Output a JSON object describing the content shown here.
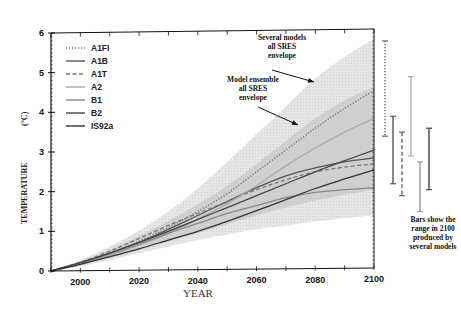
{
  "chart_data": {
    "type": "line",
    "title": "",
    "xlabel": "YEAR",
    "ylabel": "TEMPERATURE",
    "ylabel_unit": "(°C)",
    "xlim": [
      1990,
      2100
    ],
    "ylim": [
      0,
      6
    ],
    "x_ticks": [
      2000,
      2020,
      2040,
      2060,
      2080,
      2100
    ],
    "y_ticks": [
      0,
      1,
      2,
      3,
      4,
      5,
      6
    ],
    "grid": false,
    "legend_position": "upper-left",
    "x": [
      1990,
      2000,
      2010,
      2020,
      2030,
      2040,
      2050,
      2060,
      2070,
      2080,
      2090,
      2100
    ],
    "series": [
      {
        "name": "A1FI",
        "style": "dotted",
        "color": "#777777",
        "values": [
          0,
          0.2,
          0.45,
          0.75,
          1.1,
          1.5,
          1.95,
          2.5,
          3.05,
          3.6,
          4.1,
          4.55
        ]
      },
      {
        "name": "A1B",
        "style": "solid",
        "color": "#555555",
        "values": [
          0,
          0.2,
          0.45,
          0.72,
          1.05,
          1.4,
          1.75,
          2.1,
          2.4,
          2.6,
          2.75,
          2.85
        ]
      },
      {
        "name": "A1T",
        "style": "dashed",
        "color": "#777777",
        "values": [
          0,
          0.22,
          0.5,
          0.82,
          1.15,
          1.45,
          1.75,
          2.05,
          2.3,
          2.5,
          2.62,
          2.7
        ]
      },
      {
        "name": "A2",
        "style": "solid",
        "color": "#aaaaaa",
        "values": [
          0,
          0.19,
          0.4,
          0.65,
          0.95,
          1.3,
          1.7,
          2.15,
          2.65,
          3.1,
          3.5,
          3.85
        ]
      },
      {
        "name": "B1",
        "style": "solid",
        "color": "#888888",
        "values": [
          0,
          0.2,
          0.43,
          0.68,
          0.95,
          1.2,
          1.45,
          1.65,
          1.85,
          1.98,
          2.05,
          2.1
        ]
      },
      {
        "name": "B2",
        "style": "solid",
        "color": "#444444",
        "values": [
          0,
          0.21,
          0.45,
          0.72,
          1.0,
          1.3,
          1.6,
          1.9,
          2.2,
          2.5,
          2.78,
          3.05
        ]
      },
      {
        "name": "IS92a",
        "style": "solid",
        "color": "#333333",
        "values": [
          0,
          0.17,
          0.36,
          0.56,
          0.78,
          1.0,
          1.25,
          1.52,
          1.8,
          2.08,
          2.32,
          2.55
        ]
      }
    ],
    "envelopes": [
      {
        "name": "Several models all SRES envelope",
        "color": "#e4e4e4",
        "lower": [
          0,
          0.12,
          0.28,
          0.45,
          0.62,
          0.78,
          0.92,
          1.05,
          1.15,
          1.25,
          1.33,
          1.4
        ],
        "upper": [
          0,
          0.28,
          0.62,
          1.02,
          1.5,
          2.08,
          2.75,
          3.45,
          4.15,
          4.85,
          5.4,
          5.85
        ]
      },
      {
        "name": "Model ensemble all SRES envelope",
        "color": "#c8c8c8",
        "lower": [
          0,
          0.14,
          0.32,
          0.52,
          0.74,
          0.96,
          1.18,
          1.4,
          1.6,
          1.78,
          1.92,
          2.05
        ],
        "upper": [
          0,
          0.24,
          0.54,
          0.88,
          1.26,
          1.68,
          2.15,
          2.7,
          3.28,
          3.85,
          4.3,
          4.65
        ]
      }
    ],
    "range_bars_2100": [
      {
        "name": "A1FI",
        "style": "dotted",
        "color": "#666666",
        "low": 3.4,
        "high": 5.8
      },
      {
        "name": "A1B",
        "style": "solid",
        "color": "#555555",
        "low": 2.2,
        "high": 3.9
      },
      {
        "name": "A1T",
        "style": "dashed",
        "color": "#666666",
        "low": 1.9,
        "high": 3.5
      },
      {
        "name": "A2",
        "style": "solid",
        "color": "#b0b0b0",
        "low": 2.9,
        "high": 4.9
      },
      {
        "name": "B1",
        "style": "solid",
        "color": "#999999",
        "low": 1.5,
        "high": 2.75
      },
      {
        "name": "B2",
        "style": "solid",
        "color": "#444444",
        "low": 2.05,
        "high": 3.6
      }
    ],
    "annotations": [
      {
        "text": [
          "Several models",
          "all SRES",
          "envelope"
        ]
      },
      {
        "text": [
          "Model ensemble",
          "all SRES",
          "envelope"
        ]
      },
      {
        "text": [
          "Bars show the",
          "range in 2100",
          "produced by",
          "several models"
        ]
      }
    ]
  }
}
